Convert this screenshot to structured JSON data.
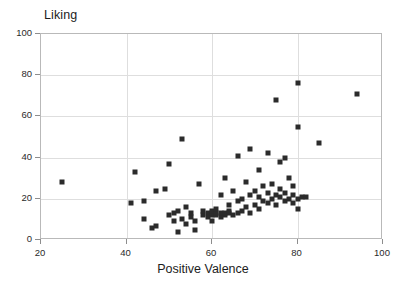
{
  "chart_data": {
    "type": "scatter",
    "title": "Liking",
    "xlabel": "Positive Valence",
    "ylabel": "Liking",
    "xlim": [
      20,
      100
    ],
    "ylim": [
      0,
      100
    ],
    "xticks": [
      20,
      40,
      60,
      80,
      100
    ],
    "yticks": [
      0,
      20,
      40,
      60,
      80,
      100
    ],
    "grid": true,
    "legend": null,
    "marker": "square",
    "marker_color": "#2b2b2b",
    "points": [
      [
        25,
        28
      ],
      [
        41,
        18
      ],
      [
        42,
        33
      ],
      [
        44,
        10
      ],
      [
        44,
        19
      ],
      [
        46,
        6
      ],
      [
        47,
        7
      ],
      [
        47,
        24
      ],
      [
        49,
        25
      ],
      [
        50,
        12
      ],
      [
        50,
        37
      ],
      [
        51,
        13
      ],
      [
        51,
        9
      ],
      [
        52,
        4
      ],
      [
        52,
        14
      ],
      [
        53,
        49
      ],
      [
        53,
        10
      ],
      [
        54,
        8
      ],
      [
        54,
        16
      ],
      [
        55,
        11
      ],
      [
        55,
        13
      ],
      [
        56,
        5
      ],
      [
        56,
        9
      ],
      [
        57,
        27
      ],
      [
        58,
        12
      ],
      [
        58,
        14
      ],
      [
        59,
        13
      ],
      [
        59,
        11
      ],
      [
        60,
        12
      ],
      [
        60,
        13
      ],
      [
        60,
        14
      ],
      [
        60,
        9
      ],
      [
        61,
        12
      ],
      [
        61,
        13
      ],
      [
        61,
        15
      ],
      [
        62,
        11
      ],
      [
        62,
        13
      ],
      [
        62,
        22
      ],
      [
        63,
        12
      ],
      [
        63,
        13
      ],
      [
        63,
        30
      ],
      [
        64,
        13
      ],
      [
        64,
        14
      ],
      [
        64,
        17
      ],
      [
        65,
        12
      ],
      [
        65,
        24
      ],
      [
        66,
        13
      ],
      [
        66,
        19
      ],
      [
        66,
        41
      ],
      [
        67,
        14
      ],
      [
        67,
        20
      ],
      [
        68,
        16
      ],
      [
        68,
        28
      ],
      [
        69,
        13
      ],
      [
        69,
        22
      ],
      [
        69,
        44
      ],
      [
        70,
        17
      ],
      [
        70,
        24
      ],
      [
        71,
        15
      ],
      [
        71,
        21
      ],
      [
        71,
        34
      ],
      [
        72,
        19
      ],
      [
        72,
        26
      ],
      [
        73,
        18
      ],
      [
        73,
        23
      ],
      [
        73,
        42
      ],
      [
        74,
        20
      ],
      [
        74,
        27
      ],
      [
        75,
        17
      ],
      [
        75,
        22
      ],
      [
        75,
        68
      ],
      [
        76,
        21
      ],
      [
        76,
        25
      ],
      [
        76,
        38
      ],
      [
        77,
        19
      ],
      [
        77,
        23
      ],
      [
        77,
        40
      ],
      [
        78,
        20
      ],
      [
        78,
        30
      ],
      [
        79,
        18
      ],
      [
        79,
        22
      ],
      [
        79,
        26
      ],
      [
        80,
        15
      ],
      [
        80,
        20
      ],
      [
        80,
        55
      ],
      [
        80,
        76
      ],
      [
        81,
        21
      ],
      [
        82,
        21
      ],
      [
        85,
        47
      ],
      [
        94,
        71
      ]
    ]
  }
}
